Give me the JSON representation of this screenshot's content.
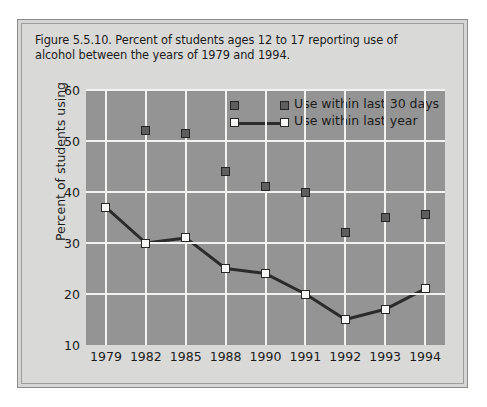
{
  "figure": {
    "caption": "Figure 5.5.10. Percent of students ages 12 to 17 reporting use of alcohol between the years of 1979 and 1994."
  },
  "colors": {
    "page_background": "#ffffff",
    "card_background": "#d9d9d7",
    "card_border": "#8b8b88",
    "plot_background": "#949494",
    "gridline": "#f2f2f0",
    "series_dark_fill": "#5e5e5e",
    "series_light_fill": "#f7f7f5",
    "marker_outline": "#262626",
    "line": "#2b2b2b",
    "text": "#1c1c1c"
  },
  "chart_data": {
    "type": "line",
    "title": "Figure 5.5.10. Percent of students ages 12 to 17 reporting use of alcohol between the years of 1979 and 1994.",
    "xlabel": "",
    "ylabel": "Percent of students using",
    "categories": [
      "1979",
      "1982",
      "1985",
      "1988",
      "1990",
      "1991",
      "1992",
      "1993",
      "1994"
    ],
    "ylim": [
      10,
      60
    ],
    "yticks": [
      10,
      20,
      30,
      40,
      50,
      60
    ],
    "grid": true,
    "legend_position": "top-center-inside",
    "series": [
      {
        "name": "Use within last 30 days",
        "marker": "filled-square",
        "line": false,
        "values": [
          null,
          52,
          51.5,
          44,
          41,
          40,
          32,
          35,
          35.5
        ]
      },
      {
        "name": "Use within last year",
        "marker": "open-square",
        "line": true,
        "values": [
          37,
          30,
          31,
          25,
          24,
          20,
          15,
          17,
          21
        ]
      }
    ]
  },
  "legend": {
    "items": [
      {
        "label": "Use within last 30 days",
        "swatch": "dark-square-swatch"
      },
      {
        "label": "Use within last year",
        "swatch": "light-square-line-swatch"
      }
    ]
  },
  "axes": {
    "y_title": "Percent of students using",
    "y_tick_labels": [
      "60",
      "50",
      "40",
      "30",
      "20",
      "10"
    ],
    "x_tick_labels": [
      "1979",
      "1982",
      "1985",
      "1988",
      "1990",
      "1991",
      "1992",
      "1993",
      "1994"
    ]
  }
}
